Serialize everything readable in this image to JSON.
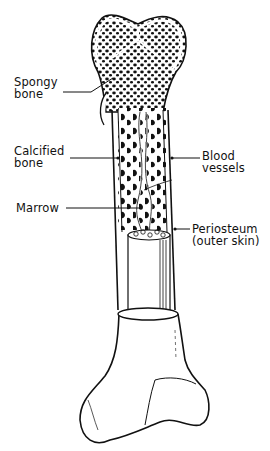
{
  "diagram": {
    "colors": {
      "ink": "#111111",
      "background": "#ffffff"
    },
    "labels": {
      "spongy_bone": {
        "line1": "Spongy",
        "line2": "bone"
      },
      "calcified_bone": {
        "line1": "Calcified",
        "line2": "bone"
      },
      "marrow": {
        "line1": "Marrow"
      },
      "blood_vessels": {
        "line1": "Blood",
        "line2": "vessels"
      },
      "periosteum": {
        "line1": "Periosteum",
        "line2": "(outer skin)"
      }
    }
  }
}
